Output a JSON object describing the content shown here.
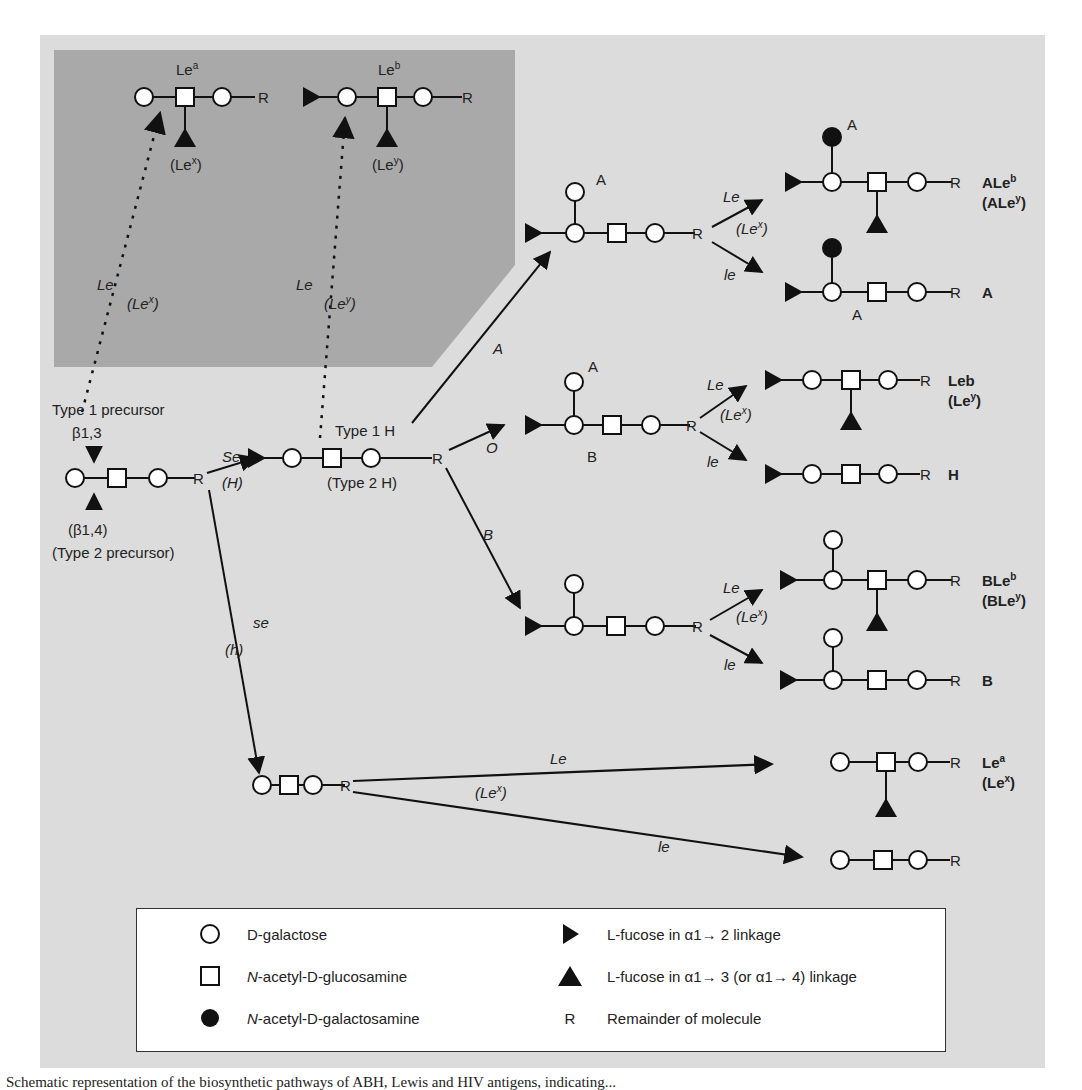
{
  "diagram": {
    "inset": {
      "lea_label": "Le",
      "lea_sup": "a",
      "lex_label": "(Le",
      "lex_sup": "x",
      "lex_close": ")",
      "leb_label": "Le",
      "leb_sup": "b",
      "ley_label": "(Le",
      "ley_sup": "y",
      "ley_close": ")",
      "arrow1_gene": "Le",
      "arrow1_alt": "(Le",
      "arrow1_alt_sup": "x",
      "arrow2_gene": "Le",
      "arrow2_alt": "(Le",
      "arrow2_alt_sup": "y"
    },
    "precursor": {
      "type1_label": "Type 1 precursor",
      "beta13": "β1,3",
      "beta14": "(β1,4)",
      "type2_label": "(Type 2 precursor)"
    },
    "secretor": {
      "se_gene": "Se",
      "h_gene": "(H)",
      "se_recessive": "se",
      "h_recessive": "(h)"
    },
    "h_structure": {
      "type1_label": "Type 1 H",
      "type2_label": "(Type 2 H)"
    },
    "branches": {
      "a_gene": "A",
      "o_gene": "O",
      "b_gene": "B",
      "a_node_label": "A",
      "o_node_top": "A",
      "o_node_bottom": "B"
    },
    "lewis_arrows": {
      "le": "Le",
      "lex": "(Le",
      "lex_sup": "x",
      "le_recessive": "le"
    },
    "products": [
      {
        "name": "ALe",
        "sup": "b",
        "alt": "(ALe",
        "alt_sup": "y"
      },
      {
        "name": "A",
        "node_label": "A"
      },
      {
        "name": "Leb",
        "alt": "(Le",
        "alt_sup": "y"
      },
      {
        "name": "H"
      },
      {
        "name": "BLe",
        "sup": "b",
        "alt": "(BLe",
        "alt_sup": "y"
      },
      {
        "name": "B"
      },
      {
        "name": "Le",
        "sup": "a",
        "alt": "(Le",
        "alt_sup": "x"
      }
    ],
    "r_symbol": "R"
  },
  "legend": {
    "items": [
      {
        "symbol": "open-circle",
        "prefix": "D",
        "text": "-galactose"
      },
      {
        "symbol": "open-square",
        "italic": "N",
        "text1": "-acetyl-",
        "sc": "D",
        "text2": "-glucosamine"
      },
      {
        "symbol": "filled-circle",
        "italic": "N",
        "text1": "-acetyl-",
        "sc": "D",
        "text2": "-galactosamine"
      },
      {
        "symbol": "right-triangle",
        "prefix": "L",
        "text": "-fucose in α1→ 2 linkage"
      },
      {
        "symbol": "up-triangle",
        "prefix": "L",
        "text": "-fucose in α1→ 3 (or α1→ 4) linkage"
      },
      {
        "symbol": "R",
        "text": "Remainder of molecule"
      }
    ]
  },
  "caption": "Schematic representation of the biosynthetic pathways of ABH, Lewis and HIV antigens, indicating..."
}
